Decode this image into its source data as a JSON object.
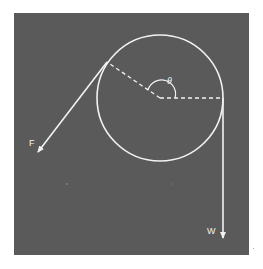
{
  "figure": {
    "background_color": "#5a5a5a",
    "line_color": "#f2f2f2",
    "labels": {
      "angle": "θ",
      "force": "F",
      "weight": "W"
    },
    "elements": {
      "circle": "pulley",
      "radius_dashed_1": "to rope contact point (F side)",
      "radius_dashed_2": "to rope contact point (W side)",
      "arc": "wrap angle marker",
      "arrow_F": "tension force F",
      "arrow_W": "weight W"
    }
  }
}
